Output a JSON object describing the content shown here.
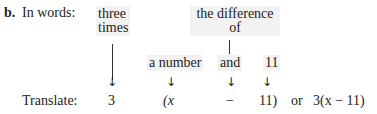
{
  "part_label": "b.",
  "in_words_label": "In words:",
  "translate_label": "Translate:",
  "words": {
    "three_times_line1": "three",
    "three_times_line2": "times",
    "difference_line1": "the difference",
    "difference_line2": "of",
    "a_number": "a number",
    "and": "and",
    "eleven": "11"
  },
  "translation": {
    "three": "3",
    "open_paren_x": "(x",
    "minus": "−",
    "eleven_close": "11)",
    "or": "or",
    "final": "3(x − 11)"
  }
}
